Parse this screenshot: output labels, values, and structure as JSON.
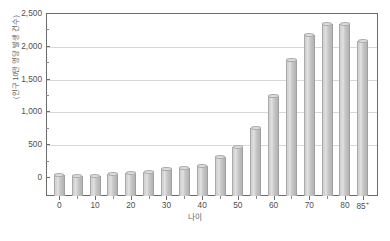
{
  "chart_data": {
    "type": "bar",
    "title": "",
    "xlabel": "나이",
    "ylabel": "(인구 10만 명당 발생 건수)",
    "ylim": [
      0,
      2500
    ],
    "ytick_step": 500,
    "ytick_minor_step": 250,
    "grid": true,
    "legend": null,
    "bar_color": "#cccccc",
    "bar_edge_color": "#a9a9a9",
    "axis_color": "#6b6b6b",
    "gridline_color": "#d8d8d8",
    "categories": [
      "0-4",
      "5-9",
      "10-14",
      "15-19",
      "20-24",
      "25-29",
      "30-34",
      "35-39",
      "40-44",
      "45-49",
      "50-54",
      "55-59",
      "60-64",
      "65-69",
      "70-74",
      "75-79",
      "80-84",
      "85+"
    ],
    "values": [
      30,
      15,
      20,
      45,
      60,
      75,
      115,
      140,
      175,
      300,
      450,
      740,
      1240,
      1790,
      2170,
      2340,
      2340,
      2080
    ],
    "yticks": [
      {
        "value": 2500,
        "label": "2,500"
      },
      {
        "value": 2000,
        "label": "2,000"
      },
      {
        "value": 1500,
        "label": "1,500"
      },
      {
        "value": 1000,
        "label": "1,000"
      },
      {
        "value": 500,
        "label": "500"
      },
      {
        "value": 0,
        "label": "0"
      }
    ],
    "yticks_minor": [
      2250,
      1750,
      1250,
      750,
      250
    ],
    "xticks": [
      {
        "index": 0,
        "label": "0"
      },
      {
        "index": 2,
        "label": "10"
      },
      {
        "index": 4,
        "label": "20"
      },
      {
        "index": 6,
        "label": "30"
      },
      {
        "index": 8,
        "label": "40"
      },
      {
        "index": 10,
        "label": "50"
      },
      {
        "index": 12,
        "label": "60"
      },
      {
        "index": 14,
        "label": "70"
      },
      {
        "index": 16,
        "label": "80"
      },
      {
        "index": 17,
        "label": "85",
        "sup": "+"
      }
    ]
  },
  "caption": ""
}
